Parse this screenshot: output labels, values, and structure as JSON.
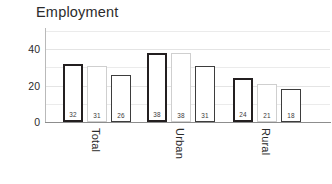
{
  "chart_data": {
    "type": "bar",
    "title": "Employment",
    "xlabel": "",
    "ylabel": "",
    "ylim": [
      0,
      50
    ],
    "yticks": [
      0,
      20,
      40
    ],
    "ytick_labels": [
      "0",
      "20",
      "40"
    ],
    "gridlines": [
      0,
      10,
      20,
      30,
      40,
      50
    ],
    "grid": true,
    "legend": "none",
    "categories": [
      "Total",
      "Urban",
      "Rural"
    ],
    "series": [
      {
        "name": "series-1",
        "values": [
          32,
          38,
          24
        ],
        "outline": "#231f20",
        "style": "thick-dark"
      },
      {
        "name": "series-2",
        "values": [
          31,
          38,
          21
        ],
        "outline": "#cfcfcf",
        "style": "light-gray"
      },
      {
        "name": "series-3",
        "values": [
          26,
          31,
          18
        ],
        "outline": "#3d3d3d",
        "style": "medium-dark"
      }
    ],
    "bar_labels": [
      [
        "32",
        "31",
        "26"
      ],
      [
        "38",
        "38",
        "31"
      ],
      [
        "24",
        "21",
        "18"
      ]
    ]
  }
}
